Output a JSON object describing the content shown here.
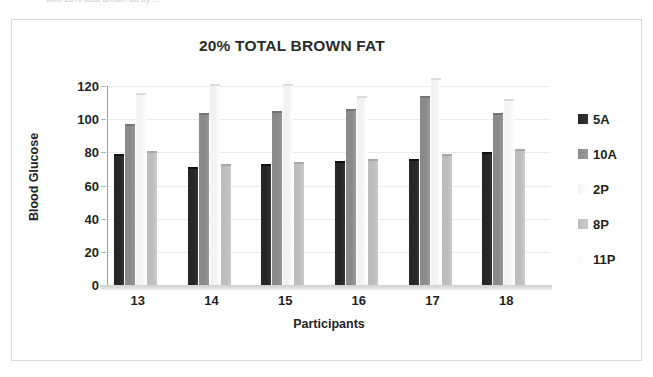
{
  "caption": {
    "text": "with 20% total brown fat by ..."
  },
  "chart_data": {
    "type": "bar",
    "title": "20% TOTAL BROWN FAT",
    "xlabel": "Participants",
    "ylabel": "Blood Glucose",
    "categories": [
      "13",
      "14",
      "15",
      "16",
      "17",
      "18"
    ],
    "ylim": [
      0,
      120
    ],
    "yticks": [
      0,
      20,
      40,
      60,
      80,
      100,
      120
    ],
    "grid": true,
    "legend_position": "right",
    "series": [
      {
        "name": "5A",
        "color": "#262626",
        "values": [
          79,
          71,
          73,
          75,
          76,
          80
        ]
      },
      {
        "name": "10A",
        "color": "#8a8a8a",
        "values": [
          97,
          104,
          105,
          106,
          114,
          104
        ]
      },
      {
        "name": "2P",
        "color": "#f2f2f2",
        "values": [
          116,
          121,
          121,
          114,
          125,
          112
        ]
      },
      {
        "name": "8P",
        "color": "#bdbdbd",
        "values": [
          81,
          73,
          74,
          76,
          79,
          82
        ]
      },
      {
        "name": "11P",
        "color": "#fafafa",
        "values": [
          0,
          0,
          0,
          0,
          0,
          0
        ]
      }
    ]
  }
}
